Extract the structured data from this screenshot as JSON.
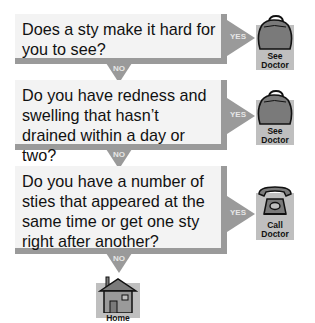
{
  "flowchart": {
    "questions": [
      {
        "text": "Does a sty make it hard for you to see?",
        "yes_label": "YES",
        "no_label": "NO",
        "action": {
          "icon": "doctor-bag-icon",
          "label_line1": "See",
          "label_line2": "Doctor"
        }
      },
      {
        "text": "Do you have redness and swelling that hasn’t drained within a day or two?",
        "yes_label": "YES",
        "no_label": "NO",
        "action": {
          "icon": "doctor-bag-icon",
          "label_line1": "See",
          "label_line2": "Doctor"
        }
      },
      {
        "text": "Do you have a number of sties that appeared at the same time or get one sty right after another?",
        "yes_label": "YES",
        "no_label": "NO",
        "action": {
          "icon": "telephone-icon",
          "label_line1": "Call",
          "label_line2": "Doctor"
        }
      }
    ],
    "final": {
      "icon": "house-icon",
      "label": "Home"
    }
  },
  "colors": {
    "box_fill": "#f3f3f3",
    "border_gray": "#9a9a9a",
    "arrow_gray": "#9a9a9a",
    "icon_bg": "#bfbfbf",
    "icon_fill": "#7a7a7a"
  }
}
